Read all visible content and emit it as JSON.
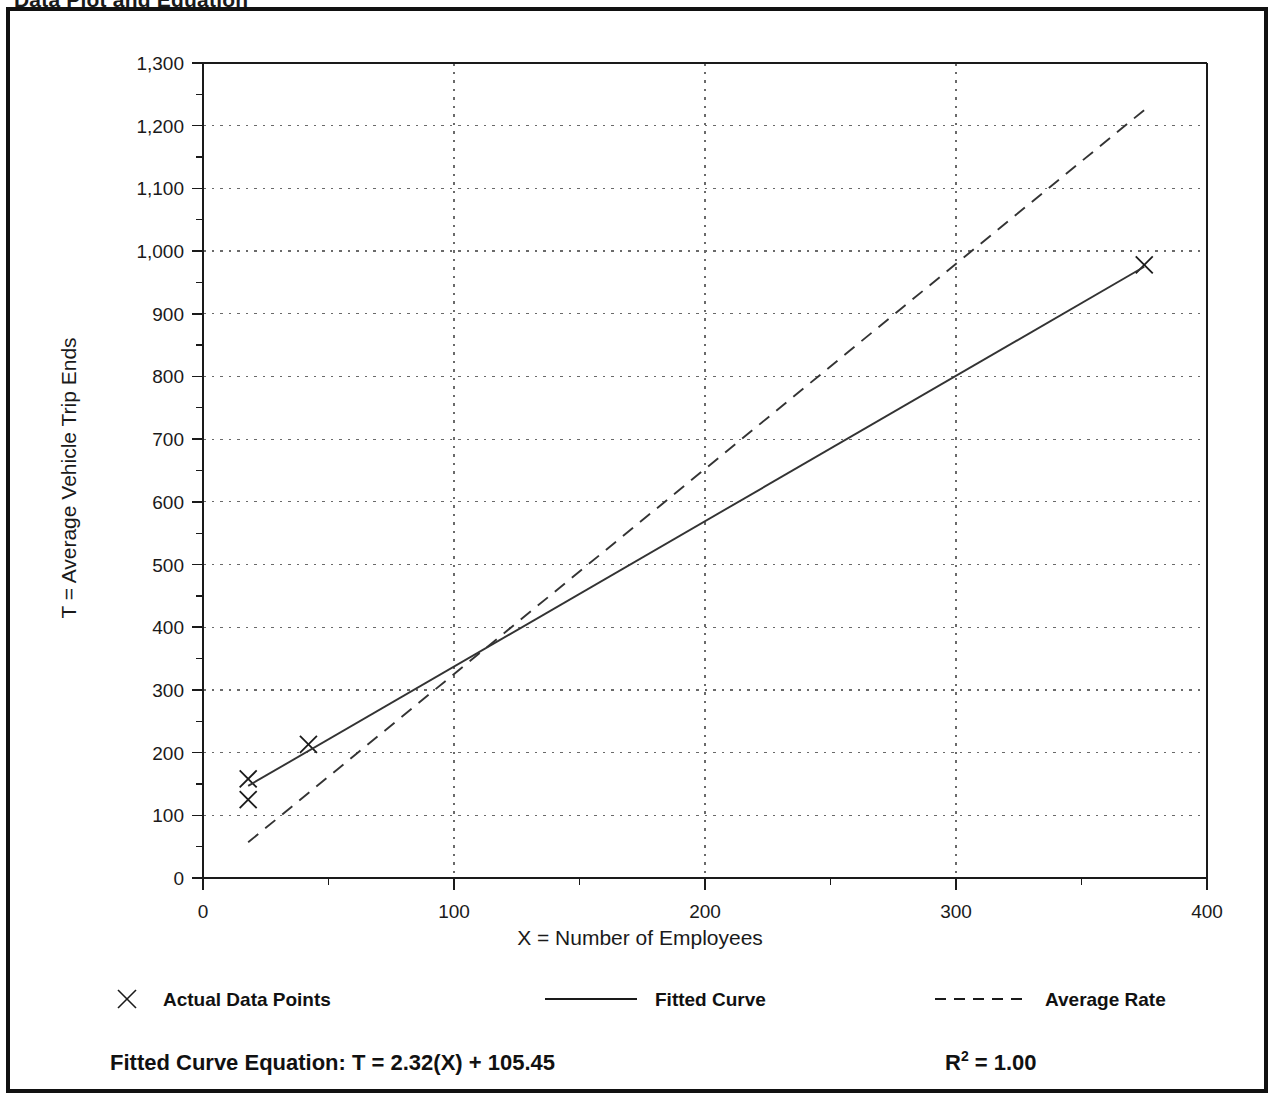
{
  "header": {
    "title": "Data Plot and Equation",
    "title_right": ""
  },
  "chart_data": {
    "type": "scatter",
    "title": "Data Plot and Equation",
    "xlabel": "X = Number of Employees",
    "ylabel": "T = Average Vehicle Trip Ends",
    "xlim": [
      0,
      400
    ],
    "ylim": [
      0,
      1300
    ],
    "xticks": [
      0,
      100,
      200,
      300,
      400
    ],
    "xtick_labels": [
      "0",
      "100",
      "200",
      "300",
      "400"
    ],
    "xminor_step": 50,
    "yticks": [
      0,
      100,
      200,
      300,
      400,
      500,
      600,
      700,
      800,
      900,
      1000,
      1100,
      1200,
      1300
    ],
    "ytick_labels": [
      "0",
      "100",
      "200",
      "300",
      "400",
      "500",
      "600",
      "700",
      "800",
      "900",
      "1,000",
      "1,100",
      "1,200",
      "1,300"
    ],
    "yminor_step": 50,
    "grid": true,
    "grid_style": "dotted",
    "legend_position": "below-plot",
    "series": [
      {
        "name": "Actual Data Points",
        "type": "scatter",
        "marker": "x",
        "points": [
          {
            "x": 18,
            "y": 158
          },
          {
            "x": 18,
            "y": 125
          },
          {
            "x": 42,
            "y": 213
          },
          {
            "x": 375,
            "y": 978
          }
        ]
      },
      {
        "name": "Fitted Curve",
        "type": "line",
        "style": "solid",
        "points": [
          {
            "x": 18,
            "y": 147
          },
          {
            "x": 375,
            "y": 975
          }
        ]
      },
      {
        "name": "Average Rate",
        "type": "line",
        "style": "dashed",
        "points": [
          {
            "x": 18,
            "y": 57
          },
          {
            "x": 375,
            "y": 1225
          }
        ]
      }
    ]
  },
  "legend": {
    "items": [
      {
        "label": "Actual Data Points",
        "marker": "x-marker",
        "style": "marker"
      },
      {
        "label": "Fitted Curve",
        "marker": "solid-line",
        "style": "solid"
      },
      {
        "label": "Average Rate",
        "marker": "dashed-line",
        "style": "dashed"
      }
    ]
  },
  "footer": {
    "equation_label": "Fitted Curve Equation:",
    "equation_value": "T = 2.32(X) + 105.45",
    "r_squared_base": "R",
    "r_squared_exp": "2",
    "r_squared_value": " = 1.00"
  },
  "colors": {
    "ink": "#1a1a1a",
    "frame": "#111111",
    "grid": "#6a6a6a",
    "line": "#333333"
  }
}
